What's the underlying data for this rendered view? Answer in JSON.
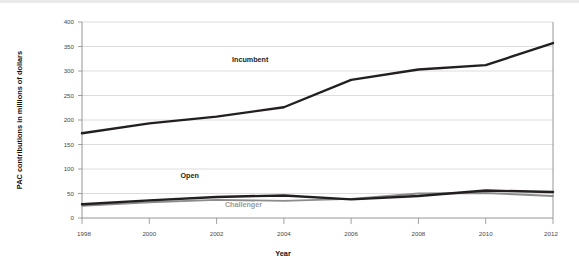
{
  "chart_data": {
    "type": "line",
    "title": "",
    "xlabel": "Year",
    "ylabel": "PAC contributions in millions of dollars",
    "x": [
      1998,
      2000,
      2002,
      2004,
      2006,
      2008,
      2010,
      2012
    ],
    "xtick_labels": [
      "1998",
      "2000",
      "2002",
      "2004",
      "2006",
      "2008",
      "2010",
      "2012"
    ],
    "ytick_labels": [
      "0",
      "50",
      "100",
      "150",
      "200",
      "250",
      "300",
      "350",
      "400"
    ],
    "yticks": [
      0,
      50,
      100,
      150,
      200,
      250,
      300,
      350,
      400
    ],
    "ylim": [
      0,
      400
    ],
    "xlim": [
      1998,
      2012
    ],
    "grid": "horizontal",
    "legend": "inline-labels",
    "series": [
      {
        "name": "Incumbent",
        "color": "#231f20",
        "values": [
          173,
          193,
          207,
          226,
          282,
          303,
          312,
          357
        ],
        "label_x": 2003.0,
        "label_y": 318
      },
      {
        "name": "Open",
        "color": "#231f20",
        "values": [
          28,
          36,
          43,
          46,
          38,
          45,
          56,
          53
        ],
        "label_x": 2001.2,
        "label_y": 82
      },
      {
        "name": "Challenger",
        "color": "#8c8c8c",
        "values": [
          25,
          32,
          37,
          35,
          39,
          50,
          51,
          45
        ],
        "label_x": 2002.8,
        "label_y": 22
      }
    ]
  },
  "axes": {
    "y_title": "PAC contributions in millions of dollars",
    "x_title": "Year"
  }
}
